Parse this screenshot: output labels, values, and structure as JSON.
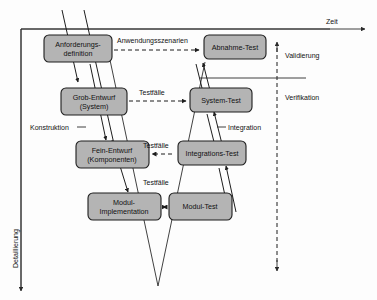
{
  "diagram": {
    "colors": {
      "box_fill": "#b4b4b4",
      "box_stroke": "#1d1d1d",
      "line": "#1d1d1d",
      "background": "#fdfdfd"
    },
    "axes": {
      "time": {
        "label": "Zeit",
        "orientation": "horizontal",
        "direction": "right"
      },
      "detail": {
        "label": "Detaillierung",
        "orientation": "vertical",
        "direction": "down"
      },
      "scope": {
        "label": "",
        "orientation": "vertical",
        "direction": "both"
      }
    },
    "left_branch": [
      {
        "id": "anforderungsdefinition",
        "line1": "Anforderungs-",
        "line2": "definition"
      },
      {
        "id": "grob-entwurf",
        "line1": "Grob-Entwurf",
        "line2": "(System)"
      },
      {
        "id": "fein-entwurf",
        "line1": "Fein-Entwurf",
        "line2": "(Komponenten)"
      },
      {
        "id": "modul-implementation",
        "line1": "Modul-",
        "line2": "Implementation"
      }
    ],
    "right_branch": [
      {
        "id": "abnahme-test",
        "line1": "Abnahme-Test",
        "line2": ""
      },
      {
        "id": "system-test",
        "line1": "System-Test",
        "line2": ""
      },
      {
        "id": "integrations-test",
        "line1": "Integrations-Test",
        "line2": ""
      },
      {
        "id": "modul-test",
        "line1": "Modul-Test",
        "line2": ""
      }
    ],
    "cross_links": [
      {
        "id": "anwendungsszenarien",
        "label": "Anwendungsszenarien",
        "style": "dashed"
      },
      {
        "id": "testfaelle-system",
        "label": "Testfälle",
        "style": "dashed"
      },
      {
        "id": "testfaelle-integration",
        "label": "Testfälle",
        "style": "dashed"
      },
      {
        "id": "testfaelle-modul",
        "label": "Testfälle",
        "style": "solid"
      }
    ],
    "annotations": [
      {
        "id": "validierung",
        "label": "Validierung"
      },
      {
        "id": "verifikation",
        "label": "Verifikation"
      },
      {
        "id": "konstruktion",
        "label": "Konstruktion"
      },
      {
        "id": "integration",
        "label": "Integration"
      }
    ]
  }
}
